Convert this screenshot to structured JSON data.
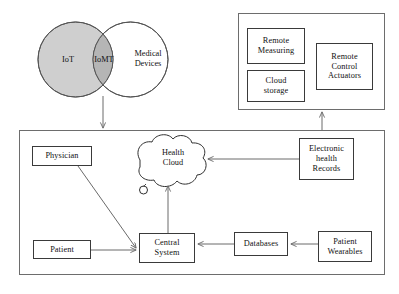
{
  "diagram": {
    "venn": {
      "left_circle": {
        "label": "IoT",
        "fill": "#cfcfcf",
        "stroke": "#555555"
      },
      "intersection": {
        "label": "IoMT",
        "fill": "#b4b4b4"
      },
      "right_circle": {
        "label": "Medical Devices",
        "label_line1": "Medical",
        "label_line2": "Devices",
        "fill": "#ffffff",
        "stroke": "#555555"
      }
    },
    "capability_panel": {
      "boxes": [
        {
          "name": "remote-measuring",
          "line1": "Remote",
          "line2": "Measuring"
        },
        {
          "name": "cloud-storage",
          "line1": "Cloud",
          "line2": "storage"
        },
        {
          "name": "remote-control-actuators",
          "line1": "Remote",
          "line2": "Control",
          "line3": "Actuators"
        }
      ]
    },
    "system_panel": {
      "nodes": [
        {
          "name": "physician",
          "label": "Physician"
        },
        {
          "name": "patient",
          "label": "Patient"
        },
        {
          "name": "central-system",
          "line1": "Central",
          "line2": "System"
        },
        {
          "name": "health-cloud",
          "line1": "Health",
          "line2": "Cloud"
        },
        {
          "name": "electronic-health-records",
          "line1": "Electronic",
          "line2": "health",
          "line3": "Records"
        },
        {
          "name": "databases",
          "label": "Databases"
        },
        {
          "name": "patient-wearables",
          "line1": "Patient",
          "line2": "Wearables"
        }
      ]
    },
    "colors": {
      "stroke": "#3a3a3a",
      "panel_stroke": "#6d6d6d",
      "arrow": "#6a6a6a",
      "text": "#101010"
    }
  }
}
